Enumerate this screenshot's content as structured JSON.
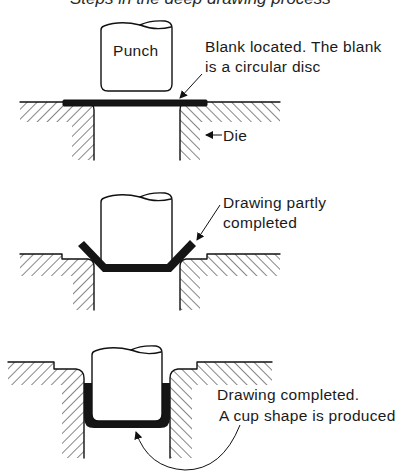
{
  "figure": {
    "title": "Steps in the deep drawing process",
    "stages": [
      {
        "id": "stage-1",
        "punch_label": "Punch",
        "annotation_lines": [
          "Blank located. The blank",
          "is a circular disc"
        ],
        "die_label": "Die"
      },
      {
        "id": "stage-2",
        "annotation_lines": [
          "Drawing partly",
          "completed"
        ]
      },
      {
        "id": "stage-3",
        "annotation_lines": [
          "Drawing completed.",
          "A cup shape is produced"
        ]
      }
    ]
  },
  "colors": {
    "line": "#111111",
    "blank_fill": "#151515",
    "background": "#ffffff"
  }
}
